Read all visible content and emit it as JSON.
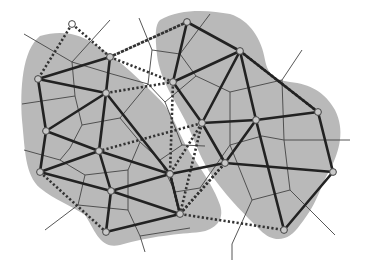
{
  "diagram": {
    "title": "",
    "colors": {
      "region_fill": "#b9b9b9",
      "solid_edge": "#222222",
      "dotted_edge": "#333333",
      "voronoi_line": "#444444",
      "node_fill": "#c8c8c8",
      "node_stroke": "#444444"
    },
    "regions": [
      {
        "name": "left-cluster",
        "path": "M40,36 C60,30 80,32 100,48 C120,60 140,80 160,100 C175,115 180,140 195,160 C205,175 215,190 220,205 C225,220 215,230 200,232 C180,234 150,236 120,245 C100,250 95,230 85,215 C70,205 55,200 40,188 C25,175 25,150 22,120 C20,90 22,50 40,36 Z"
      },
      {
        "name": "right-cluster",
        "path": "M160,20 C180,8 210,10 230,14 C250,20 262,40 265,60 C268,75 275,80 290,82 C310,84 325,92 335,110 C345,130 340,150 330,170 C320,185 320,200 300,225 C290,240 275,245 260,230 C245,215 230,200 215,180 C200,160 195,140 185,120 C175,100 160,80 157,55 C155,35 155,25 160,20 Z"
      }
    ],
    "nodes": [
      {
        "id": "A",
        "x": 72,
        "y": 24,
        "hollow": true
      },
      {
        "id": "B",
        "x": 110,
        "y": 57
      },
      {
        "id": "C",
        "x": 38,
        "y": 79
      },
      {
        "id": "D",
        "x": 106,
        "y": 93
      },
      {
        "id": "E",
        "x": 46,
        "y": 131
      },
      {
        "id": "F",
        "x": 99,
        "y": 151
      },
      {
        "id": "G",
        "x": 40,
        "y": 172
      },
      {
        "id": "H",
        "x": 170,
        "y": 174
      },
      {
        "id": "I",
        "x": 111,
        "y": 191
      },
      {
        "id": "J",
        "x": 180,
        "y": 214
      },
      {
        "id": "K",
        "x": 106,
        "y": 232
      },
      {
        "id": "L",
        "x": 187,
        "y": 22
      },
      {
        "id": "M",
        "x": 240,
        "y": 51
      },
      {
        "id": "N",
        "x": 173,
        "y": 82
      },
      {
        "id": "O",
        "x": 318,
        "y": 112
      },
      {
        "id": "P",
        "x": 202,
        "y": 123
      },
      {
        "id": "Q",
        "x": 256,
        "y": 120
      },
      {
        "id": "R",
        "x": 225,
        "y": 163
      },
      {
        "id": "S",
        "x": 333,
        "y": 172
      },
      {
        "id": "T",
        "x": 284,
        "y": 230
      }
    ],
    "solid_edges": [
      [
        "C",
        "B"
      ],
      [
        "C",
        "D"
      ],
      [
        "B",
        "D"
      ],
      [
        "C",
        "E"
      ],
      [
        "D",
        "E"
      ],
      [
        "D",
        "F"
      ],
      [
        "D",
        "H"
      ],
      [
        "E",
        "F"
      ],
      [
        "E",
        "G"
      ],
      [
        "F",
        "G"
      ],
      [
        "F",
        "H"
      ],
      [
        "F",
        "I"
      ],
      [
        "G",
        "I"
      ],
      [
        "H",
        "I"
      ],
      [
        "I",
        "J"
      ],
      [
        "H",
        "J"
      ],
      [
        "I",
        "K"
      ],
      [
        "K",
        "J"
      ],
      [
        "L",
        "M"
      ],
      [
        "L",
        "N"
      ],
      [
        "N",
        "M"
      ],
      [
        "M",
        "P"
      ],
      [
        "M",
        "Q"
      ],
      [
        "N",
        "P"
      ],
      [
        "P",
        "Q"
      ],
      [
        "Q",
        "O"
      ],
      [
        "M",
        "O"
      ],
      [
        "P",
        "R"
      ],
      [
        "Q",
        "R"
      ],
      [
        "Q",
        "T"
      ],
      [
        "R",
        "S"
      ],
      [
        "O",
        "S"
      ],
      [
        "S",
        "T"
      ],
      [
        "R",
        "H"
      ]
    ],
    "dotted_edges": [
      [
        "A",
        "C"
      ],
      [
        "A",
        "B"
      ],
      [
        "B",
        "L"
      ],
      [
        "B",
        "N"
      ],
      [
        "D",
        "N"
      ],
      [
        "N",
        "H"
      ],
      [
        "P",
        "F"
      ],
      [
        "M",
        "O"
      ],
      [
        "P",
        "H"
      ],
      [
        "H",
        "J"
      ],
      [
        "R",
        "J"
      ],
      [
        "P",
        "J"
      ],
      [
        "J",
        "T"
      ],
      [
        "G",
        "K"
      ],
      [
        "R",
        "J"
      ],
      [
        "L",
        "B"
      ]
    ],
    "voronoi_edges": [
      [
        22,
        104,
        75,
        96
      ],
      [
        75,
        96,
        72,
        62
      ],
      [
        72,
        62,
        24,
        34
      ],
      [
        72,
        62,
        110,
        20
      ],
      [
        72,
        62,
        112,
        74
      ],
      [
        112,
        74,
        148,
        84
      ],
      [
        75,
        96,
        82,
        125
      ],
      [
        82,
        125,
        70,
        148
      ],
      [
        82,
        125,
        120,
        118
      ],
      [
        120,
        118,
        148,
        84
      ],
      [
        148,
        84,
        152,
        50
      ],
      [
        152,
        50,
        139,
        18
      ],
      [
        152,
        50,
        180,
        54
      ],
      [
        180,
        54,
        210,
        14
      ],
      [
        180,
        54,
        196,
        76
      ],
      [
        196,
        76,
        230,
        92
      ],
      [
        230,
        92,
        282,
        80
      ],
      [
        282,
        80,
        302,
        50
      ],
      [
        282,
        80,
        284,
        140
      ],
      [
        230,
        92,
        230,
        145
      ],
      [
        196,
        76,
        165,
        102
      ],
      [
        165,
        102,
        148,
        84
      ],
      [
        165,
        102,
        182,
        145
      ],
      [
        182,
        145,
        160,
        160
      ],
      [
        160,
        160,
        140,
        142
      ],
      [
        140,
        142,
        120,
        118
      ],
      [
        140,
        142,
        128,
        170
      ],
      [
        128,
        170,
        85,
        175
      ],
      [
        85,
        175,
        60,
        160
      ],
      [
        60,
        160,
        24,
        150
      ],
      [
        60,
        160,
        70,
        148
      ],
      [
        85,
        175,
        78,
        205
      ],
      [
        78,
        205,
        45,
        230
      ],
      [
        78,
        205,
        128,
        210
      ],
      [
        128,
        210,
        128,
        170
      ],
      [
        128,
        210,
        140,
        236
      ],
      [
        140,
        236,
        145,
        252
      ],
      [
        140,
        236,
        190,
        228
      ],
      [
        160,
        160,
        175,
        192
      ],
      [
        175,
        192,
        200,
        188
      ],
      [
        200,
        188,
        230,
        145
      ],
      [
        230,
        145,
        262,
        136
      ],
      [
        262,
        136,
        284,
        140
      ],
      [
        284,
        140,
        350,
        140
      ],
      [
        284,
        140,
        290,
        190
      ],
      [
        290,
        190,
        335,
        235
      ],
      [
        290,
        190,
        252,
        200
      ],
      [
        252,
        200,
        230,
        145
      ],
      [
        252,
        200,
        232,
        244
      ],
      [
        232,
        244,
        232,
        260
      ],
      [
        182,
        145,
        205,
        146
      ]
    ]
  }
}
